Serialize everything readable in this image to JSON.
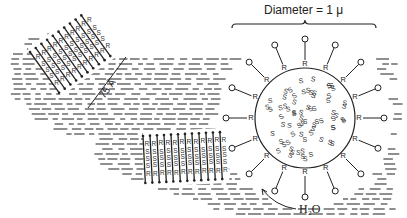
{
  "figure": {
    "type": "schematic",
    "labels": {
      "diameter": "Diameter = 1 μ",
      "thickness": "75 Å",
      "water": "H₂O"
    },
    "symbols": {
      "polar_group": "R",
      "nonpolar_group": "S",
      "head": "O"
    },
    "colors": {
      "ink": "#222222",
      "background": "#ffffff"
    }
  }
}
